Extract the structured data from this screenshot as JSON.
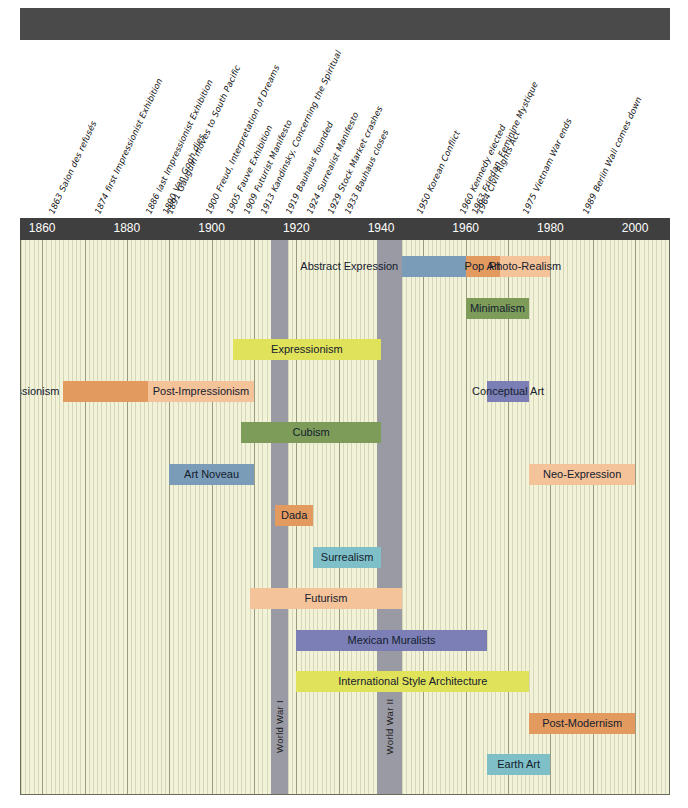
{
  "title_bar": {
    "label": ""
  },
  "axis": {
    "ticks": [
      1860,
      1880,
      1900,
      1920,
      1940,
      1960,
      1980,
      2000
    ],
    "start_year": 1855,
    "end_year": 2008
  },
  "events": [
    {
      "year": 1863,
      "label": "1863 Salon des refusés"
    },
    {
      "year": 1874,
      "label": "1874 first Impressionist Exhibition"
    },
    {
      "year": 1886,
      "label": "1886 last Impressionist Exhibition"
    },
    {
      "year": 1890,
      "label": "1890 Van Gogh dies"
    },
    {
      "year": 1891,
      "label": "1891 Gauguin moves to South Pacific"
    },
    {
      "year": 1900,
      "label": "1900 Freud, Interpretation of Dreams"
    },
    {
      "year": 1905,
      "label": "1905 Fauve Exhibition"
    },
    {
      "year": 1909,
      "label": "1909 Futurist Manifesto"
    },
    {
      "year": 1913,
      "label": "1913 Kandinsky, Concerning the Spiritual"
    },
    {
      "year": 1919,
      "label": "1919 Bauhaus founded"
    },
    {
      "year": 1924,
      "label": "1924 Surrealist Manifesto"
    },
    {
      "year": 1929,
      "label": "1929 Stock Market crashes"
    },
    {
      "year": 1933,
      "label": "1933 Bauhaus closes"
    },
    {
      "year": 1950,
      "label": "1950 Korean Conflict"
    },
    {
      "year": 1960,
      "label": "1960 Kennedy elected"
    },
    {
      "year": 1963,
      "label": "1963 Friedan, Feminine Mystique"
    },
    {
      "year": 1964,
      "label": "1964 Civil Rights Act"
    },
    {
      "year": 1975,
      "label": "1975 Vietnam War ends"
    },
    {
      "year": 1989,
      "label": "1989 Berlin Wall comes down"
    }
  ],
  "wars": [
    {
      "label": "World War I",
      "start": 1914,
      "end": 1918
    },
    {
      "label": "World War II",
      "start": 1939,
      "end": 1945
    }
  ],
  "chart_data": {
    "type": "timeline",
    "title": "",
    "xlabel": "",
    "ylabel": "",
    "xlim": [
      1855,
      2008
    ],
    "grid": true,
    "legend": "none",
    "movements": [
      {
        "name": "Abstract Expression",
        "start": 1945,
        "end": 1960,
        "color": "#7a9cb8",
        "row": 0,
        "text_pos": "left-out"
      },
      {
        "name": "Pop Art",
        "start": 1960,
        "end": 1968,
        "color": "#e39a5e",
        "row": 0,
        "text_pos": "center"
      },
      {
        "name": "Photo-Realism",
        "start": 1968,
        "end": 1980,
        "color": "#f4c39a",
        "row": 0,
        "text_pos": "center"
      },
      {
        "name": "Minimalism",
        "start": 1960,
        "end": 1975,
        "color": "#7d9c5a",
        "row": 1,
        "text_pos": "center"
      },
      {
        "name": "Expressionism",
        "start": 1905,
        "end": 1940,
        "color": "#e0e25a",
        "row": 2,
        "text_pos": "center"
      },
      {
        "name": "Conceptual Art",
        "start": 1965,
        "end": 1975,
        "color": "#7b7fb5",
        "row": 3,
        "text_pos": "center"
      },
      {
        "name": "Impressionism",
        "start": 1865,
        "end": 1885,
        "color": "#e39a5e",
        "row": 3,
        "text_pos": "left-out"
      },
      {
        "name": "Post-Impressionism",
        "start": 1885,
        "end": 1910,
        "color": "#f4c39a",
        "row": 3,
        "text_pos": "center"
      },
      {
        "name": "Cubism",
        "start": 1907,
        "end": 1940,
        "color": "#7d9c5a",
        "row": 4,
        "text_pos": "center"
      },
      {
        "name": "Art Noveau",
        "start": 1890,
        "end": 1910,
        "color": "#7a9cb8",
        "row": 5,
        "text_pos": "center"
      },
      {
        "name": "Neo-Expression",
        "start": 1975,
        "end": 2000,
        "color": "#f4c39a",
        "row": 5,
        "text_pos": "center"
      },
      {
        "name": "Dada",
        "start": 1915,
        "end": 1924,
        "color": "#e39a5e",
        "row": 6,
        "text_pos": "center"
      },
      {
        "name": "Surrealism",
        "start": 1924,
        "end": 1940,
        "color": "#7fc0c8",
        "row": 7,
        "text_pos": "center"
      },
      {
        "name": "Futurism",
        "start": 1909,
        "end": 1945,
        "color": "#f4c39a",
        "row": 8,
        "text_pos": "center"
      },
      {
        "name": "Mexican Muralists",
        "start": 1920,
        "end": 1965,
        "color": "#7b7fb5",
        "row": 9,
        "text_pos": "center"
      },
      {
        "name": "International Style Architecture",
        "start": 1920,
        "end": 1975,
        "color": "#e0e25a",
        "row": 10,
        "text_pos": "center"
      },
      {
        "name": "Post-Modernism",
        "start": 1975,
        "end": 2000,
        "color": "#e39a5e",
        "row": 11,
        "text_pos": "center"
      },
      {
        "name": "Earth Art",
        "start": 1965,
        "end": 1980,
        "color": "#7fc0c8",
        "row": 12,
        "text_pos": "center"
      }
    ]
  }
}
